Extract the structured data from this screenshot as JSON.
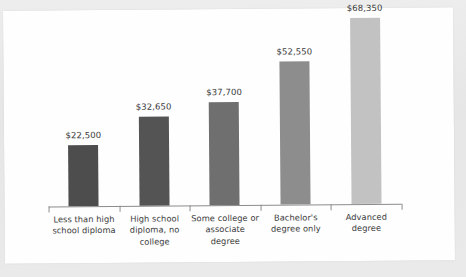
{
  "chart_data": {
    "type": "bar",
    "title": "",
    "subtitle": "",
    "xlabel": "",
    "ylabel": "",
    "categories": [
      "Less than high school diploma",
      "High school diploma, no college",
      "Some college or associate degree",
      "Bachelor's degree only",
      "Advanced degree"
    ],
    "category_lines": [
      [
        "Less than high",
        "school diploma"
      ],
      [
        "High school",
        "diploma, no",
        "college"
      ],
      [
        "Some college or",
        "associate",
        "degree"
      ],
      [
        "Bachelor's",
        "degree only"
      ],
      [
        "Advanced",
        "degree"
      ]
    ],
    "values": [
      22500,
      32650,
      37700,
      52550,
      68350
    ],
    "value_labels": [
      "$22,500",
      "$32,650",
      "$37,700",
      "$52,550",
      "$68,350"
    ],
    "bar_colors": [
      "#4d4d4d",
      "#545454",
      "#6f6f6f",
      "#8d8d8d",
      "#c2c2c2"
    ],
    "ylim": [
      0,
      72000
    ],
    "grid": false,
    "legend": false,
    "axis_color": "#8c8c8c",
    "background": "#fefefe"
  }
}
